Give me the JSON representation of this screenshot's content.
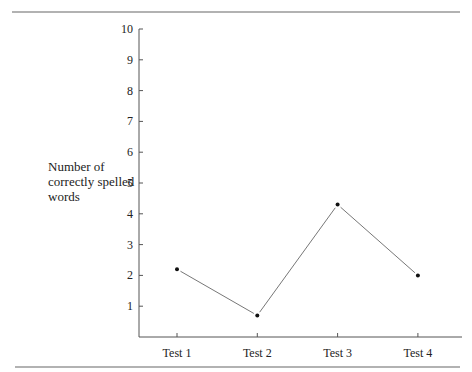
{
  "chart_data": {
    "type": "line",
    "title": "",
    "xlabel": "",
    "ylabel": "Number of correctly spelled words",
    "ylabel_lines": [
      "Number of",
      "correctly spelled",
      "words"
    ],
    "categories": [
      "Test 1",
      "Test 2",
      "Test 3",
      "Test 4"
    ],
    "series": [
      {
        "name": "Correctly spelled words",
        "values": [
          2.2,
          0.7,
          4.3,
          2.0
        ]
      }
    ],
    "ylim": [
      0,
      10
    ],
    "yticks": [
      1,
      2,
      3,
      4,
      5,
      6,
      7,
      8,
      9,
      10
    ],
    "grid": false,
    "legend": "none",
    "colors": {
      "line": "#777777",
      "marker": "#111111",
      "axis": "#555555",
      "rule": "#666666"
    }
  }
}
